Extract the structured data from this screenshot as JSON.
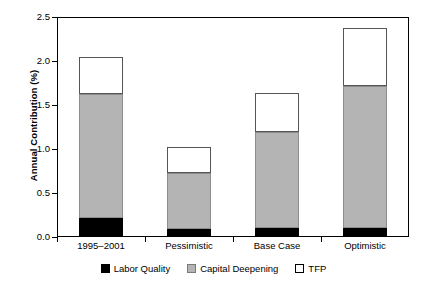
{
  "chart_data": {
    "type": "bar",
    "title": "",
    "subtitle": "",
    "xlabel": "",
    "ylabel": "Annual Contribution (%)",
    "ylim": [
      0.0,
      2.5
    ],
    "ytick_labels": [
      "0.0",
      "0.5",
      "1.0",
      "1.5",
      "2.0",
      "2.5"
    ],
    "ytick_values": [
      0.0,
      0.5,
      1.0,
      1.5,
      2.0,
      2.5
    ],
    "grid": false,
    "stacked": true,
    "legend_position": "bottom",
    "categories": [
      "1995–2001",
      "Pessimistic",
      "Base Case",
      "Optimistic"
    ],
    "series": [
      {
        "name": "Labor Quality",
        "color": "#000000",
        "values": [
          0.22,
          0.09,
          0.1,
          0.1
        ]
      },
      {
        "name": "Capital Deepening",
        "color": "#b4b4b4",
        "values": [
          1.41,
          0.64,
          1.09,
          1.62
        ]
      },
      {
        "name": "TFP",
        "color": "#ffffff",
        "values": [
          0.42,
          0.29,
          0.45,
          0.66
        ]
      }
    ],
    "totals": [
      2.05,
      1.02,
      1.64,
      2.38
    ]
  },
  "axes": {
    "y_title": "Annual Contribution (%)",
    "y_ticks": [
      {
        "label": "2.5",
        "value": 2.5
      },
      {
        "label": "2.0",
        "value": 2.0
      },
      {
        "label": "1.5",
        "value": 1.5
      },
      {
        "label": "1.0",
        "value": 1.0
      },
      {
        "label": "0.5",
        "value": 0.5
      },
      {
        "label": "0.0",
        "value": 0.0
      }
    ],
    "x_categories": [
      {
        "label": "1995–2001"
      },
      {
        "label": "Pessimistic"
      },
      {
        "label": "Base Case"
      },
      {
        "label": "Optimistic"
      }
    ]
  },
  "legend": {
    "items": [
      {
        "label": "Labor Quality",
        "swatch": "black-square-icon"
      },
      {
        "label": "Capital Deepening",
        "swatch": "gray-square-icon"
      },
      {
        "label": "TFP",
        "swatch": "white-square-icon"
      }
    ]
  }
}
